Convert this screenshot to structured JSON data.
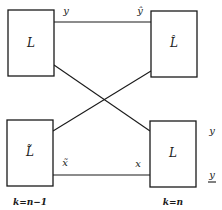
{
  "diagram": {
    "boxes": {
      "top_left": "L",
      "top_right": "L̂",
      "bottom_left": "L̃",
      "bottom_right": "L"
    },
    "signals": {
      "top_left_out": "y",
      "top_right_in": "ŷ",
      "bottom_left_out": "x̃",
      "bottom_right_in": "x",
      "right_upper": "y",
      "right_lower": "y"
    },
    "stage_labels": {
      "left": "k=n−1",
      "right": "k=n"
    },
    "colors": {
      "stroke": "#1a1a1a",
      "background": "#ffffff"
    }
  }
}
